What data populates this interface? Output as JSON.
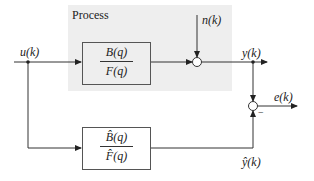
{
  "diagram": {
    "region": {
      "label": "Process",
      "fill": "#eeeeee"
    },
    "blocks": [
      {
        "id": "process-tf",
        "numerator": "B(q)",
        "denominator": "F(q)"
      },
      {
        "id": "model-tf",
        "numerator": "B̂(q)",
        "denominator": "F̂(q)"
      }
    ],
    "signals": {
      "input": "u(k)",
      "noise": "n(k)",
      "output": "y(k)",
      "error": "e(k)",
      "model_output": "ŷ(k)"
    },
    "summing_junctions": [
      {
        "id": "noise-sum",
        "inputs": [
          "+",
          "+"
        ]
      },
      {
        "id": "error-sum",
        "signs": {
          "top": "+",
          "bottom": "−"
        }
      }
    ],
    "minus_sign": "−",
    "colors": {
      "line": "#333333",
      "region": "#eeeeee",
      "block_border": "#555555"
    }
  }
}
